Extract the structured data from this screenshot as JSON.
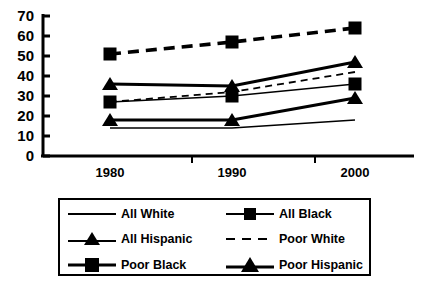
{
  "chart_data": {
    "type": "line",
    "title": "",
    "xlabel": "",
    "ylabel": "",
    "x": [
      1980,
      1990,
      2000
    ],
    "categories": [
      "1980",
      "1990",
      "2000"
    ],
    "xtick_labels": [
      "1980",
      "1990",
      "2000"
    ],
    "ytick_labels": [
      "0",
      "10",
      "20",
      "30",
      "40",
      "50",
      "60",
      "70"
    ],
    "yticks": [
      0,
      10,
      20,
      30,
      40,
      50,
      60,
      70
    ],
    "ylim": [
      0,
      70
    ],
    "grid": false,
    "legend_position": "below-plot",
    "series": [
      {
        "name": "All White",
        "values": [
          14,
          14,
          18
        ],
        "style": "solid-thin",
        "marker": "none"
      },
      {
        "name": "All Black",
        "values": [
          27,
          30,
          36
        ],
        "style": "solid-thin",
        "marker": "square"
      },
      {
        "name": "All Hispanic",
        "values": [
          18,
          18,
          29
        ],
        "style": "solid-thick",
        "marker": "triangle"
      },
      {
        "name": "Poor White",
        "values": [
          27,
          32,
          42
        ],
        "style": "dashed-thin",
        "marker": "none"
      },
      {
        "name": "Poor Black",
        "values": [
          51,
          57,
          64
        ],
        "style": "dashed-thick",
        "marker": "square"
      },
      {
        "name": "Poor Hispanic",
        "values": [
          36,
          35,
          47
        ],
        "style": "solid-thick",
        "marker": "triangle"
      }
    ]
  },
  "legend": {
    "entries": [
      {
        "label": "All White"
      },
      {
        "label": "All  Black"
      },
      {
        "label": "All  Hispanic"
      },
      {
        "label": "Poor White"
      },
      {
        "label": "Poor  Black"
      },
      {
        "label": "Poor  Hispanic"
      }
    ]
  },
  "colors": {
    "ink": "#000000",
    "background": "#ffffff"
  }
}
